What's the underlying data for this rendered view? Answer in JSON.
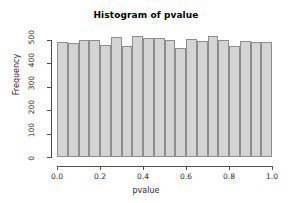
{
  "chart_data": {
    "type": "bar",
    "title": "Histogram of pvalue",
    "xlabel": "pvalue",
    "ylabel": "Frequency",
    "xlim": [
      0.0,
      1.0
    ],
    "ylim": [
      0,
      520
    ],
    "grid": false,
    "legend": null,
    "bin_width": 0.05,
    "bar_fill_color": "#d4d4d4",
    "bar_border_color": "#8d8d8d",
    "axis_color": "#4d4d4d",
    "xticks": [
      {
        "value": 0.0,
        "label": "0.0"
      },
      {
        "value": 0.2,
        "label": "0.2"
      },
      {
        "value": 0.4,
        "label": "0.4"
      },
      {
        "value": 0.6,
        "label": "0.6"
      },
      {
        "value": 0.8,
        "label": "0.8"
      },
      {
        "value": 1.0,
        "label": "1.0"
      }
    ],
    "yticks": [
      {
        "value": 0,
        "label": "0"
      },
      {
        "value": 100,
        "label": "100"
      },
      {
        "value": 200,
        "label": "200"
      },
      {
        "value": 300,
        "label": "300"
      },
      {
        "value": 400,
        "label": "400"
      },
      {
        "value": 500,
        "label": "500"
      }
    ],
    "bins": [
      {
        "x0": 0.0,
        "x1": 0.05,
        "value": 493
      },
      {
        "x0": 0.05,
        "x1": 0.1,
        "value": 488
      },
      {
        "x0": 0.1,
        "x1": 0.15,
        "value": 498
      },
      {
        "x0": 0.15,
        "x1": 0.2,
        "value": 499
      },
      {
        "x0": 0.2,
        "x1": 0.25,
        "value": 480
      },
      {
        "x0": 0.25,
        "x1": 0.3,
        "value": 512
      },
      {
        "x0": 0.3,
        "x1": 0.35,
        "value": 474
      },
      {
        "x0": 0.35,
        "x1": 0.4,
        "value": 518
      },
      {
        "x0": 0.4,
        "x1": 0.45,
        "value": 508
      },
      {
        "x0": 0.45,
        "x1": 0.5,
        "value": 507
      },
      {
        "x0": 0.5,
        "x1": 0.55,
        "value": 502
      },
      {
        "x0": 0.55,
        "x1": 0.6,
        "value": 464
      },
      {
        "x0": 0.6,
        "x1": 0.65,
        "value": 506
      },
      {
        "x0": 0.65,
        "x1": 0.7,
        "value": 496
      },
      {
        "x0": 0.7,
        "x1": 0.75,
        "value": 518
      },
      {
        "x0": 0.75,
        "x1": 0.8,
        "value": 500
      },
      {
        "x0": 0.8,
        "x1": 0.85,
        "value": 473
      },
      {
        "x0": 0.85,
        "x1": 0.9,
        "value": 495
      },
      {
        "x0": 0.9,
        "x1": 0.95,
        "value": 492
      },
      {
        "x0": 0.95,
        "x1": 1.0,
        "value": 492
      }
    ]
  }
}
